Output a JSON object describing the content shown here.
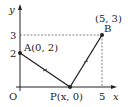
{
  "diagram": {
    "axes": {
      "x_label": "x",
      "y_label": "y",
      "origin_label": "O"
    },
    "ticks": {
      "y_3": "3",
      "y_2": "2",
      "x_5": "5"
    },
    "points": {
      "A": {
        "label": "A(0, 2)",
        "x": 0,
        "y": 2
      },
      "B": {
        "name": "B",
        "coord_label": "(5, 3)",
        "x": 5,
        "y": 3
      },
      "P": {
        "label": "P(x, 0)",
        "x": "x",
        "y": 0
      }
    },
    "colors": {
      "line": "#222222",
      "dashed": "#555555",
      "background": "#ffffff"
    }
  }
}
